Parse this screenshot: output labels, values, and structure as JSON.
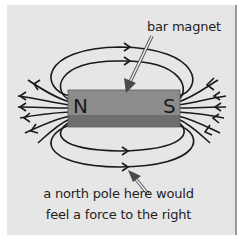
{
  "diagram": {
    "labels": {
      "bar_magnet": "bar magnet",
      "force_note_line1": "a north pole here would",
      "force_note_line2": "feel a force to the right"
    },
    "magnet": {
      "north_pole": "N",
      "south_pole": "S",
      "top_color": "#8c8c8c",
      "bottom_color": "#6e6e6e"
    },
    "colors": {
      "background": "#e6e6e6",
      "field_line": "#1a1a1a",
      "pointer_arrow": "#707070"
    },
    "field_direction": "from N to S (left to right above and below the magnet)"
  }
}
